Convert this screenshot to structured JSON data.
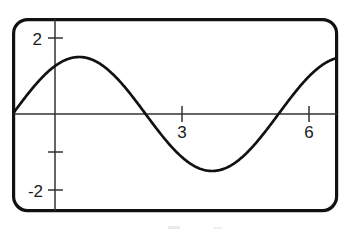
{
  "figure": {
    "name": "sine-curve-graph",
    "frame": {
      "style": "rounded-rectangle",
      "stroke_color": "#111111",
      "fill_color": "#ffffff",
      "corner_radius": 14,
      "stroke_width": 3.2,
      "left": 12,
      "top": 18,
      "right": 338,
      "bottom": 212
    },
    "axis_color": "#333333",
    "curve_color": "#111111",
    "curve_width": 2.6,
    "axis_width": 1.4,
    "tick_width": 1.4
  },
  "chart_data": {
    "type": "line",
    "title": "",
    "subtitle": "",
    "xlabel": "",
    "ylabel": "",
    "xlim": [
      -1.02,
      6.68
    ],
    "ylim": [
      -2.53,
      2.53
    ],
    "grid": false,
    "legend": null,
    "annotations": [],
    "x_ticks": [
      {
        "value": 3,
        "label": "3",
        "labeled": true
      },
      {
        "value": 6,
        "label": "6",
        "labeled": true
      }
    ],
    "y_ticks": [
      {
        "value": 2,
        "label": "2",
        "labeled": true
      },
      {
        "value": -1,
        "label": "",
        "labeled": false
      },
      {
        "value": -2,
        "label": "-2",
        "labeled": true
      }
    ],
    "series": [
      {
        "name": "sine-wave",
        "function": "1.5*sin(x + 1)",
        "amplitude": 1.5,
        "period": 6.28,
        "phase_shift": -1,
        "vertical_shift": 0,
        "x": [
          -1.02,
          -0.75,
          -0.5,
          -0.25,
          0,
          0.25,
          0.5,
          0.57,
          0.75,
          1,
          1.25,
          1.5,
          1.75,
          2,
          2.14,
          2.25,
          2.5,
          2.75,
          3,
          3.25,
          3.5,
          3.75,
          4,
          4.25,
          4.5,
          4.71,
          5,
          5.25,
          5.5,
          5.75,
          6,
          6.25,
          6.5,
          6.68
        ],
        "y": [
          -0.03,
          0.4,
          0.75,
          1.05,
          1.26,
          1.42,
          1.49,
          1.5,
          1.48,
          1.37,
          1.19,
          1.0,
          0.72,
          0.42,
          0.21,
          0.11,
          -0.21,
          -0.51,
          -0.78,
          -1.04,
          -1.24,
          -1.39,
          -1.47,
          -1.5,
          -1.45,
          -1.35,
          -1.13,
          -0.9,
          -0.64,
          -0.36,
          -0.07,
          0.23,
          0.52,
          0.72
        ],
        "zero_crossings": [
          -1.0,
          2.14,
          5.28
        ],
        "peak": {
          "x": 0.57,
          "y": 1.5
        },
        "trough": {
          "x": 3.71,
          "y": -1.5
        }
      }
    ]
  },
  "labels": {
    "y_top": "2",
    "y_bottom": "-2",
    "x_mid": "3",
    "x_right": "6"
  }
}
